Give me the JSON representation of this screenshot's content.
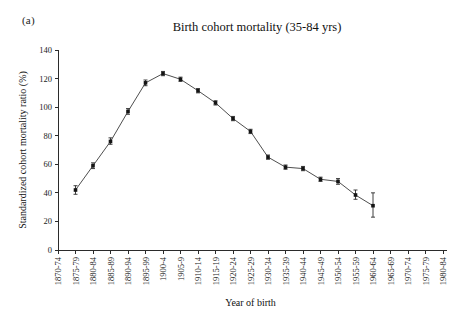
{
  "figure": {
    "panel_label": "(a)",
    "title": "Birth cohort mortality (35-84 yrs)",
    "background": "#ffffff",
    "line_color": "#3a3a3a",
    "marker_color": "#141414"
  },
  "chart_data": {
    "type": "line",
    "title": "Birth cohort mortality (35-84 yrs)",
    "xlabel": "Year of birth",
    "ylabel": "Standardized cohort mortality ratio (%)",
    "ylim": [
      0,
      140
    ],
    "yticks": [
      0,
      20,
      40,
      60,
      80,
      100,
      120,
      140
    ],
    "grid": false,
    "legend": "none",
    "categories": [
      "1870-74",
      "1875-79",
      "1880-84",
      "1885-89",
      "1890-94",
      "1895-99",
      "1900-4",
      "1905-9",
      "1910-14",
      "1915-19",
      "1920-24",
      "1925-29",
      "1930-34",
      "1935-39",
      "1940-44",
      "1945-49",
      "1950-54",
      "1955-59",
      "1960-64",
      "1965-69",
      "1970-74",
      "1975-79",
      "1980-84"
    ],
    "series": [
      {
        "name": "Standardized cohort mortality ratio",
        "points": [
          {
            "x": "1875-79",
            "y": 42,
            "err_low": 39,
            "err_high": 45
          },
          {
            "x": "1880-84",
            "y": 59,
            "err_low": 57,
            "err_high": 61
          },
          {
            "x": "1885-89",
            "y": 76,
            "err_low": 74,
            "err_high": 78.5
          },
          {
            "x": "1890-94",
            "y": 97,
            "err_low": 95,
            "err_high": 99
          },
          {
            "x": "1895-99",
            "y": 117,
            "err_low": 115,
            "err_high": 119
          },
          {
            "x": "1900-4",
            "y": 123.5,
            "err_low": 122,
            "err_high": 125
          },
          {
            "x": "1905-9",
            "y": 119.5,
            "err_low": 118,
            "err_high": 121
          },
          {
            "x": "1910-14",
            "y": 111.5,
            "err_low": 110,
            "err_high": 113
          },
          {
            "x": "1915-19",
            "y": 103,
            "err_low": 101.5,
            "err_high": 104.5
          },
          {
            "x": "1920-24",
            "y": 92,
            "err_low": 90.5,
            "err_high": 93.5
          },
          {
            "x": "1925-29",
            "y": 83,
            "err_low": 81.5,
            "err_high": 84.5
          },
          {
            "x": "1930-34",
            "y": 65,
            "err_low": 63.5,
            "err_high": 66.5
          },
          {
            "x": "1935-39",
            "y": 58,
            "err_low": 56.5,
            "err_high": 59.5
          },
          {
            "x": "1940-44",
            "y": 57,
            "err_low": 55.5,
            "err_high": 58.5
          },
          {
            "x": "1945-49",
            "y": 49.5,
            "err_low": 48,
            "err_high": 51
          },
          {
            "x": "1950-54",
            "y": 48,
            "err_low": 46,
            "err_high": 50
          },
          {
            "x": "1955-59",
            "y": 38.5,
            "err_low": 35.5,
            "err_high": 42
          },
          {
            "x": "1960-64",
            "y": 31,
            "err_low": 23,
            "err_high": 40
          }
        ]
      }
    ]
  }
}
